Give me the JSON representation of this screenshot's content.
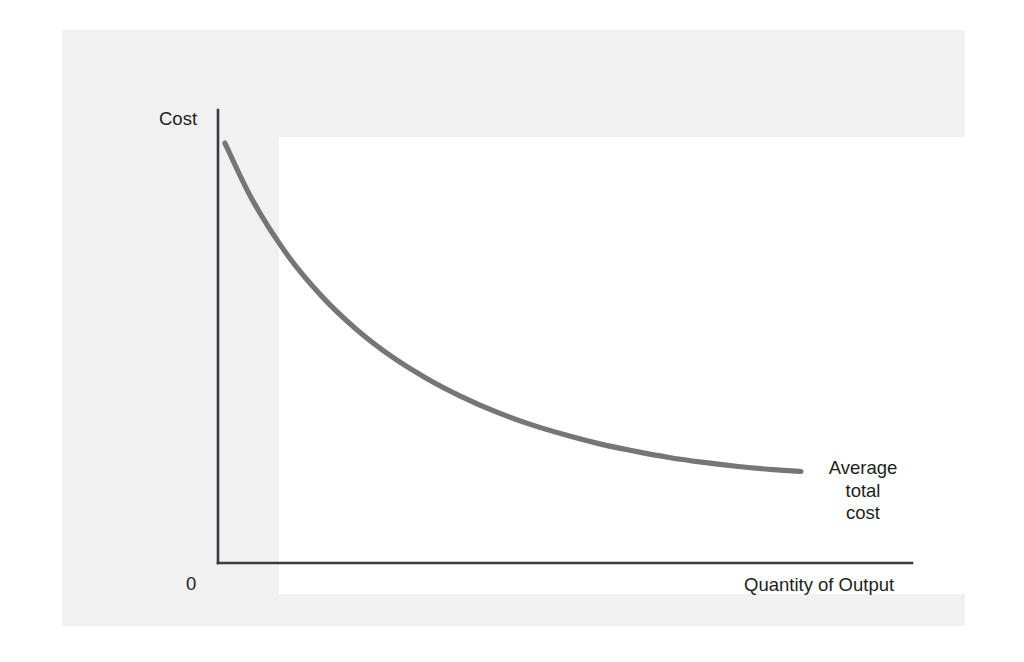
{
  "figure": {
    "background_color": "#f1f1f1",
    "plot_background_color": "#ffffff",
    "axis_color": "#3a3a42",
    "curve_color": "#767676",
    "text_color": "#201f20"
  },
  "chart_data": {
    "type": "line",
    "title": "",
    "subtitle": "",
    "xlabel": "Quantity of Output",
    "ylabel": "Cost",
    "origin_label": "0",
    "grid": false,
    "legend_position": "inline-right-annotation",
    "annotations": [
      {
        "name": "average-total-cost",
        "lines": [
          "Average",
          "total",
          "cost"
        ],
        "text": "Average total cost",
        "anchor_x": 0.845,
        "anchor_y": 0.205
      }
    ],
    "axis_ranges": {
      "xlim": [
        0,
        1
      ],
      "ylim": [
        0,
        1
      ]
    },
    "tick_labels": {
      "x": [],
      "y": []
    },
    "series": [
      {
        "name": "Average total cost",
        "description": "Downward-sloping convex average total cost curve, steeply falling then flattening toward an asymptote",
        "x": [
          0.01,
          0.05,
          0.1,
          0.15,
          0.2,
          0.25,
          0.3,
          0.35,
          0.4,
          0.45,
          0.5,
          0.55,
          0.6,
          0.65,
          0.7,
          0.75,
          0.8,
          0.84
        ],
        "y": [
          0.927,
          0.8,
          0.68,
          0.588,
          0.515,
          0.456,
          0.408,
          0.368,
          0.334,
          0.306,
          0.283,
          0.263,
          0.247,
          0.233,
          0.222,
          0.213,
          0.206,
          0.202
        ]
      }
    ]
  },
  "labels": {
    "y_axis_title": "Cost",
    "x_axis_title": "Quantity of Output",
    "origin": "0",
    "annotation_line_1": "Average",
    "annotation_line_2": "total",
    "annotation_line_3": "cost"
  }
}
